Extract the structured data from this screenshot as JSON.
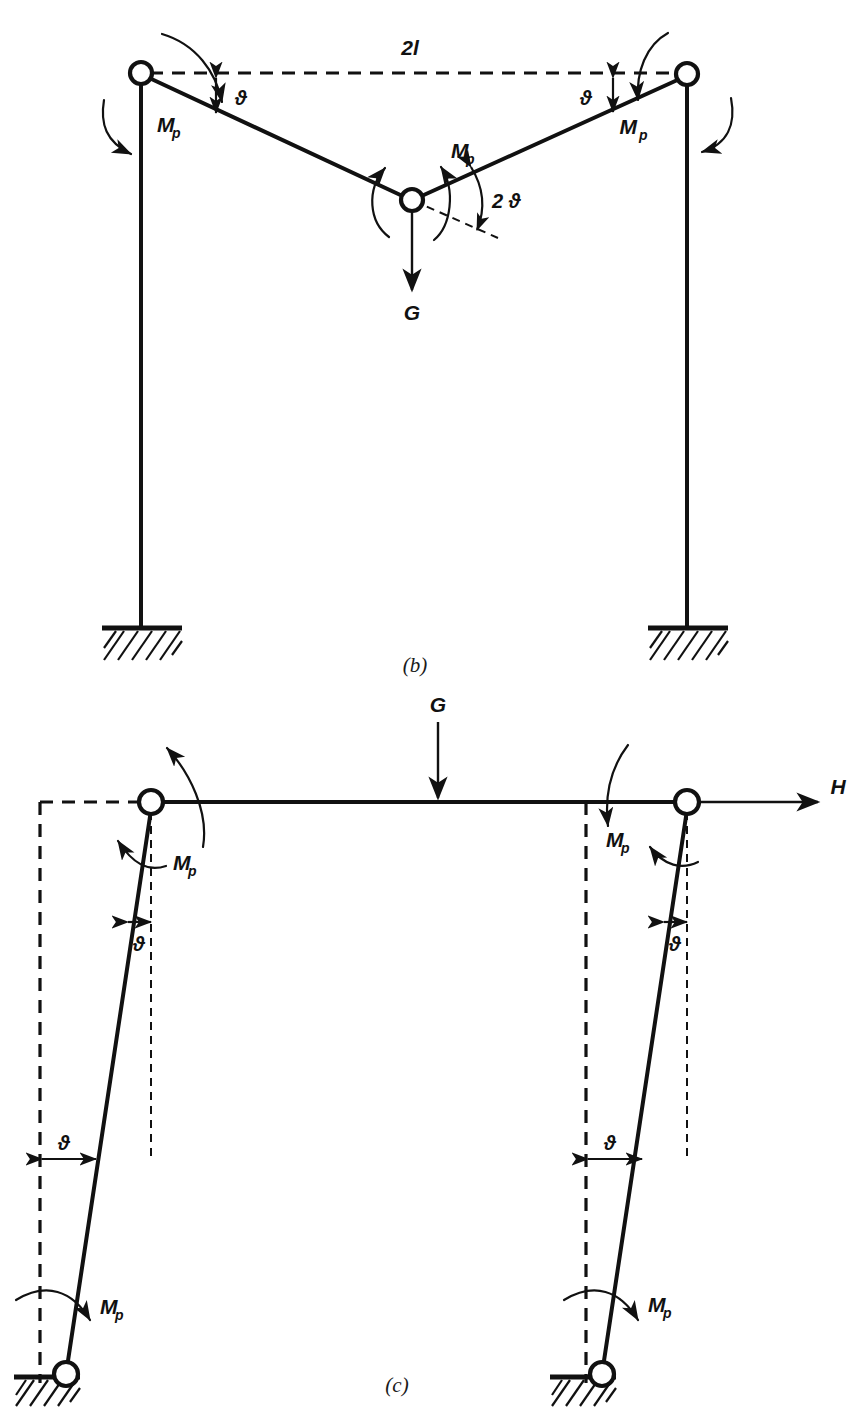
{
  "figure": {
    "background_color": "#ffffff",
    "ink_color": "#111111"
  },
  "panels": [
    {
      "id": "panel-b",
      "caption": "(b)",
      "description": "Gable (beam) collapse mechanism with three plastic hinges and a vertical load G at the apex",
      "labels": {
        "span": "2l",
        "plastic_moment": "M",
        "plastic_moment_sub": "p",
        "rotation": "ϑ",
        "rotation_double": "2 ϑ",
        "load": "G"
      },
      "annotations": [
        {
          "name": "span-dimension",
          "text": "2l"
        },
        {
          "name": "left-eaves-moment",
          "text": "Mp"
        },
        {
          "name": "left-rotation",
          "text": "ϑ"
        },
        {
          "name": "apex-moment",
          "text": "Mp"
        },
        {
          "name": "apex-rotation",
          "text": "2 ϑ"
        },
        {
          "name": "apex-load",
          "text": "G"
        },
        {
          "name": "right-rotation",
          "text": "ϑ"
        },
        {
          "name": "right-eaves-moment",
          "text": "Mp"
        }
      ],
      "supports": [
        "fixed-hatched-base-left",
        "fixed-hatched-base-right"
      ],
      "hinges": [
        "left-eaves-hinge",
        "apex-hinge",
        "right-eaves-hinge"
      ]
    },
    {
      "id": "panel-c",
      "caption": "(c)",
      "description": "Sway collapse mechanism with four plastic hinges, vertical load G and horizontal load H",
      "labels": {
        "plastic_moment": "M",
        "plastic_moment_sub": "p",
        "rotation": "ϑ",
        "vertical_load": "G",
        "horizontal_load": "H"
      },
      "annotations": [
        {
          "name": "vertical-load",
          "text": "G"
        },
        {
          "name": "horizontal-load",
          "text": "H"
        },
        {
          "name": "left-top-moment",
          "text": "Mp"
        },
        {
          "name": "left-top-rotation",
          "text": "ϑ"
        },
        {
          "name": "left-mid-rotation",
          "text": "ϑ"
        },
        {
          "name": "left-base-moment",
          "text": "Mp"
        },
        {
          "name": "right-top-moment",
          "text": "Mp"
        },
        {
          "name": "right-top-rotation",
          "text": "ϑ"
        },
        {
          "name": "right-mid-rotation",
          "text": "ϑ"
        },
        {
          "name": "right-base-moment",
          "text": "Mp"
        }
      ],
      "supports": [
        "pinned-hatched-base-left",
        "pinned-hatched-base-right"
      ],
      "hinges": [
        "left-joint-hinge",
        "right-joint-hinge",
        "left-base-hinge",
        "right-base-hinge"
      ]
    }
  ]
}
